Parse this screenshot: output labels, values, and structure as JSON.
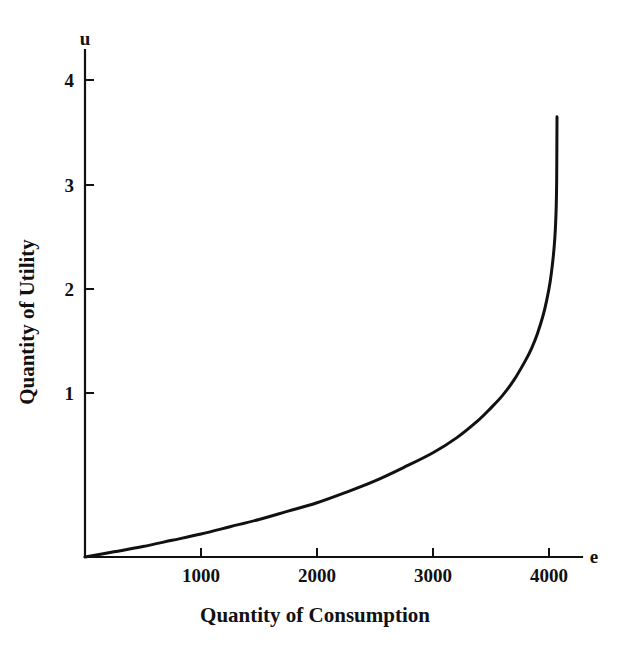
{
  "chart_data": {
    "type": "line",
    "title": "",
    "subtitle": "",
    "xlabel": "Quantity of Consumption",
    "ylabel": "Quantity of Utility",
    "x_axis_variable": "e",
    "y_axis_variable": "u",
    "xlim": [
      0,
      4250
    ],
    "ylim": [
      0,
      4.45
    ],
    "xticks": [
      1000,
      2000,
      3000,
      4000
    ],
    "xtick_labels": [
      "1000",
      "2000",
      "3000",
      "4000"
    ],
    "yticks": [
      1,
      2,
      3,
      4
    ],
    "ytick_labels": [
      "1",
      "2",
      "3",
      "4"
    ],
    "grid": false,
    "legend": null,
    "annotations": [],
    "line_color": "#111111",
    "background_color": "#ffffff",
    "series": [
      {
        "name": "utility",
        "description": "Utility rises slowly then increases steeply toward a vertical asymptote near e = 4080",
        "x": [
          0,
          250,
          500,
          750,
          1000,
          1250,
          1500,
          1750,
          2000,
          2250,
          2500,
          2750,
          3000,
          3200,
          3400,
          3500,
          3600,
          3700,
          3800,
          3850,
          3900,
          3950,
          3980,
          4010,
          4030,
          4045,
          4055,
          4062,
          4066,
          4069
        ],
        "y": [
          0,
          0.05,
          0.1,
          0.16,
          0.22,
          0.29,
          0.36,
          0.44,
          0.52,
          0.62,
          0.73,
          0.86,
          1.0,
          1.14,
          1.32,
          1.43,
          1.55,
          1.7,
          1.89,
          2.0,
          2.14,
          2.32,
          2.46,
          2.64,
          2.81,
          2.98,
          3.15,
          3.35,
          3.6,
          4.22
        ]
      }
    ]
  },
  "axes": {
    "y_var_label": "u",
    "x_var_label": "e",
    "x_title": "Quantity of Consumption",
    "y_title": "Quantity of Utility"
  }
}
